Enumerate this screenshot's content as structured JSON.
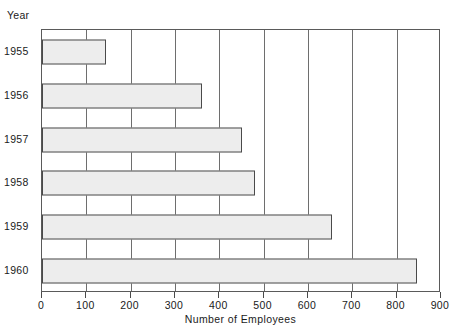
{
  "chart_data": {
    "type": "bar",
    "orientation": "horizontal",
    "title": "",
    "xlabel": "Number of Employees",
    "ylabel": "Year",
    "categories": [
      "1955",
      "1956",
      "1957",
      "1958",
      "1959",
      "1960"
    ],
    "values": [
      145,
      360,
      450,
      480,
      655,
      845
    ],
    "xlim": [
      0,
      900
    ],
    "xticks": [
      0,
      100,
      200,
      300,
      400,
      500,
      600,
      700,
      800,
      900
    ],
    "xtick_labels": [
      "0",
      "100",
      "200",
      "300",
      "400",
      "500",
      "600",
      "700",
      "800",
      "900"
    ],
    "grid": "vertical",
    "legend": null,
    "bar_fill_color": "#ededed",
    "bar_edge_color": "#4a4a4a",
    "axis_color": "#5a5a5a",
    "gridline_color": "#6e6e6e",
    "background_color": "#ffffff"
  }
}
